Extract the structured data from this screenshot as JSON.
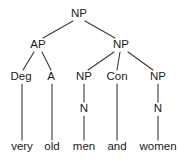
{
  "figure": {
    "kind": "constituency-syntax-tree",
    "sentence": "very old men and women",
    "background_color": "#ffffff",
    "text_color": "#1a1a1a",
    "line_color": "#3a3a3a"
  },
  "nodes": {
    "root_np": {
      "label": "NP",
      "x": 79,
      "y": 14
    },
    "ap": {
      "label": "AP",
      "x": 38,
      "y": 45
    },
    "np_right": {
      "label": "NP",
      "x": 121,
      "y": 45
    },
    "deg": {
      "label": "Deg",
      "x": 21,
      "y": 77
    },
    "a": {
      "label": "A",
      "x": 51,
      "y": 77
    },
    "np_men": {
      "label": "NP",
      "x": 84,
      "y": 77
    },
    "con": {
      "label": "Con",
      "x": 117,
      "y": 77
    },
    "np_women": {
      "label": "NP",
      "x": 158,
      "y": 77
    },
    "n_men": {
      "label": "N",
      "x": 84,
      "y": 109
    },
    "n_women": {
      "label": "N",
      "x": 158,
      "y": 109
    }
  },
  "leaves": {
    "very": {
      "label": "very",
      "x": 22,
      "y": 147
    },
    "old": {
      "label": "old",
      "x": 52,
      "y": 147
    },
    "men": {
      "label": "men",
      "x": 84,
      "y": 147
    },
    "and": {
      "label": "and",
      "x": 117,
      "y": 147
    },
    "women": {
      "label": "women",
      "x": 158,
      "y": 147
    }
  }
}
